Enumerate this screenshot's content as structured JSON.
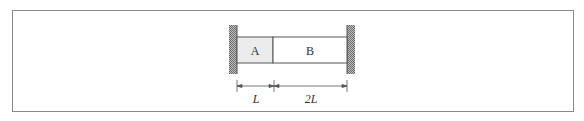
{
  "diagram": {
    "segments": [
      {
        "label": "A",
        "length_label": "L",
        "fill": "#ececec"
      },
      {
        "label": "B",
        "length_label": "2L",
        "fill": "#ffffff"
      }
    ],
    "supports": [
      "fixed-wall-left",
      "fixed-wall-right"
    ]
  }
}
